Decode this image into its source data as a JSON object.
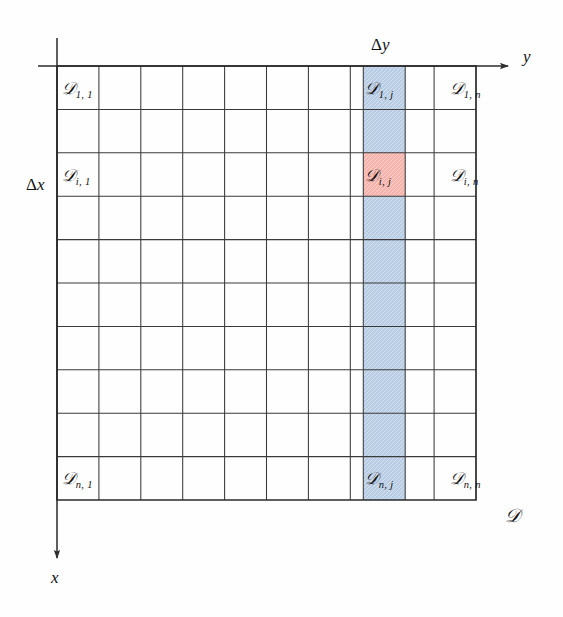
{
  "figure": {
    "background_color": "#fefefe",
    "line_color": "#2e2e2e",
    "text_color": "#121212"
  },
  "grid": {
    "rows": 10,
    "cols": 10,
    "left": 57,
    "top": 66,
    "right": 476,
    "bottom": 500,
    "highlight_column_index": 7,
    "highlight_row_index": 2,
    "column_color": "#b9cde4",
    "cell_color": "#f6b4ac"
  },
  "axes": {
    "y_axis": {
      "label": "y",
      "direction": "right",
      "origin_x": 57,
      "origin_y": 66,
      "end_x": 512
    },
    "x_axis": {
      "label": "x",
      "direction": "down",
      "origin_x": 57,
      "origin_y": 66,
      "end_y": 562
    }
  },
  "annotations": {
    "delta_y": {
      "delta": "Δ",
      "var": "y"
    },
    "delta_x": {
      "delta": "Δ",
      "var": "x"
    },
    "domain": "𝒟"
  },
  "cell_labels": [
    {
      "id": "D-1-1",
      "symbol": "𝒟",
      "subscript": "1, 1",
      "row": 0,
      "col": 0,
      "x": 62,
      "y": 80
    },
    {
      "id": "D-1-j",
      "symbol": "𝒟",
      "subscript": "1, j",
      "row": 0,
      "col": 7,
      "x": 365,
      "y": 80
    },
    {
      "id": "D-1-n",
      "symbol": "𝒟",
      "subscript": "1, n",
      "row": 0,
      "col": 9,
      "x": 450,
      "y": 80
    },
    {
      "id": "D-i-1",
      "symbol": "𝒟",
      "subscript": "i, 1",
      "row": 2,
      "col": 0,
      "x": 62,
      "y": 167
    },
    {
      "id": "D-i-j",
      "symbol": "𝒟",
      "subscript": "i, j",
      "row": 2,
      "col": 7,
      "x": 365,
      "y": 167
    },
    {
      "id": "D-i-n",
      "symbol": "𝒟",
      "subscript": "i, n",
      "row": 2,
      "col": 9,
      "x": 450,
      "y": 167
    },
    {
      "id": "D-n-1",
      "symbol": "𝒟",
      "subscript": "n, 1",
      "row": 9,
      "col": 0,
      "x": 62,
      "y": 470
    },
    {
      "id": "D-n-j",
      "symbol": "𝒟",
      "subscript": "n, j",
      "row": 9,
      "col": 7,
      "x": 365,
      "y": 470
    },
    {
      "id": "D-n-n",
      "symbol": "𝒟",
      "subscript": "n, n",
      "row": 9,
      "col": 9,
      "x": 450,
      "y": 470
    }
  ],
  "label_positions": {
    "delta_y": {
      "x": 371,
      "y": 36
    },
    "delta_x": {
      "x": 26,
      "y": 176
    },
    "y_axis": {
      "x": 523,
      "y": 48
    },
    "x_axis": {
      "x": 51,
      "y": 569
    },
    "domain": {
      "x": 505,
      "y": 506
    }
  }
}
